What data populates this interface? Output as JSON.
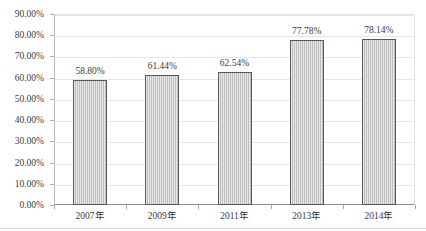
{
  "chart_data": {
    "type": "bar",
    "title": "",
    "xlabel": "",
    "ylabel": "",
    "categories": [
      "2007年",
      "2009年",
      "2011年",
      "2013年",
      "2014年"
    ],
    "values": [
      58.8,
      61.44,
      62.54,
      77.78,
      78.14
    ],
    "data_labels": [
      "58.80%",
      "61.44%",
      "62.54%",
      "77.78%",
      "78.14%"
    ],
    "ylim": [
      0,
      90
    ],
    "ytick_step": 10,
    "ytick_labels": [
      "90.00%",
      "80.00%",
      "70.00%",
      "60.00%",
      "50.00%",
      "40.00%",
      "30.00%",
      "20.00%",
      "10.00%",
      "0.00%"
    ],
    "ytick_values": [
      90,
      80,
      70,
      60,
      50,
      40,
      30,
      20,
      10,
      0
    ],
    "grid": true,
    "grid_axis": "y",
    "legend": false,
    "legend_position": "none",
    "series": [
      {
        "name": "",
        "values": [
          58.8,
          61.44,
          62.54,
          77.78,
          78.14
        ]
      }
    ],
    "colors": {
      "bar_fill": "#cbcbcb",
      "bar_border": "#575757",
      "gridline": "#e6e6e6",
      "axis_line": "#8c8c8c",
      "text": "#3c3c3c",
      "background": "#ffffff"
    }
  }
}
